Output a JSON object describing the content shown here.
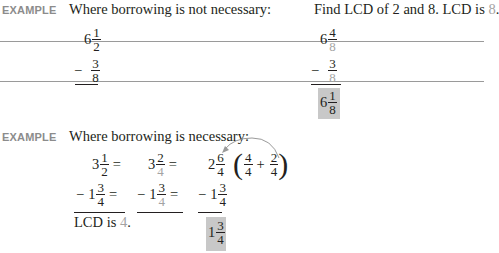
{
  "example1": {
    "label": "EXAMPLE",
    "heading": "Where borrowing is not necessary:",
    "note_prefix": "Find LCD of 2 and 8. LCD is ",
    "note_value": "8",
    "note_suffix": ".",
    "left": {
      "minuend": {
        "whole": "6",
        "num": "1",
        "den": "2"
      },
      "minus": "−",
      "subtrahend": {
        "whole": "",
        "num": "3",
        "den": "8"
      }
    },
    "right": {
      "minuend": {
        "whole": "6",
        "num": "4",
        "den": "8"
      },
      "minus": "−",
      "subtrahend": {
        "whole": "",
        "num": "3",
        "den": "8"
      },
      "answer": {
        "whole": "6",
        "num": "1",
        "den": "8"
      }
    }
  },
  "example2": {
    "label": "EXAMPLE",
    "heading": "Where borrowing is necessary:",
    "col1": {
      "top": {
        "whole": "3",
        "num": "1",
        "den": "2",
        "eq": "="
      },
      "bottom": {
        "minus": "−",
        "whole": "1",
        "num": "3",
        "den": "4",
        "eq": "="
      },
      "lcd_prefix": "LCD is ",
      "lcd_value": "4",
      "lcd_suffix": "."
    },
    "col2": {
      "top": {
        "whole": "3",
        "num": "2",
        "den": "4",
        "eq": "="
      },
      "bottom": {
        "minus": "−",
        "whole": "1",
        "num": "3",
        "den": "4",
        "eq": "="
      }
    },
    "col3": {
      "top": {
        "whole": "2",
        "num": "6",
        "den": "4"
      },
      "borrow": {
        "a_num": "4",
        "a_den": "4",
        "plus": "+",
        "b_num": "2",
        "b_den": "4"
      },
      "bottom": {
        "minus": "−",
        "whole": "1",
        "num": "3",
        "den": "4"
      },
      "answer": {
        "whole": "1",
        "num": "3",
        "den": "4"
      }
    }
  }
}
